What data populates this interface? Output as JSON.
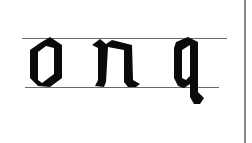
{
  "illustration": {
    "letters": [
      "o",
      "n",
      "q"
    ],
    "style": "blackletter",
    "ink_color": "#0a0a0a",
    "guide_color": "#6a6a6a",
    "border_color": "#8a8a8a",
    "background": "#ffffff"
  }
}
